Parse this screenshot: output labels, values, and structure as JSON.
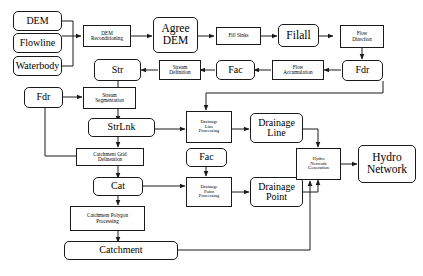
{
  "diagram": {
    "background_color": "#ffffff",
    "line_color": "#1a1a1a",
    "nodes": {
      "dem": "DEM",
      "flowline": "Flowline",
      "waterbody": "Waterbody",
      "dem_reconditioning_l1": "DEM",
      "dem_reconditioning_l2": "Reconditioning",
      "agree_dem_l1": "Agree",
      "agree_dem_l2": "DEM",
      "fill_sinks": "Fill Sinks",
      "filall": "Filall",
      "flow_direction_l1": "Flow",
      "flow_direction_l2": "Direction",
      "fdr_top": "Fdr",
      "flow_accumulation_l1": "Flow",
      "flow_accumulation_l2": "Accumulation",
      "fac_top": "Fac",
      "stream_definition_l1": "Stream",
      "stream_definition_l2": "Definition",
      "str": "Str",
      "fdr_left": "Fdr",
      "stream_segmentation_l1": "Stream",
      "stream_segmentation_l2": "Segmentation",
      "strlnk": "StrLnk",
      "catchment_grid_l1": "Catchment Grid",
      "catchment_grid_l2": "Delineation",
      "cat": "Cat",
      "catchment_polygon_l1": "Catchment Polygon",
      "catchment_polygon_l2": "Processing",
      "catchment": "Catchment",
      "drainage_line_proc_l1": "Drainage",
      "drainage_line_proc_l2": "Line",
      "drainage_line_proc_l3": "Processing",
      "drainage_line_l1": "Drainage",
      "drainage_line_l2": "Line",
      "fac_mid": "Fac",
      "drainage_point_proc_l1": "Drainage",
      "drainage_point_proc_l2": "Point",
      "drainage_point_proc_l3": "Processing",
      "drainage_point_l1": "Drainage",
      "drainage_point_l2": "Point",
      "hydro_network_gen_l1": "Hydro",
      "hydro_network_gen_l2": "Network",
      "hydro_network_gen_l3": "Generation",
      "hydro_network_l1": "Hydro",
      "hydro_network_l2": "Network"
    }
  }
}
